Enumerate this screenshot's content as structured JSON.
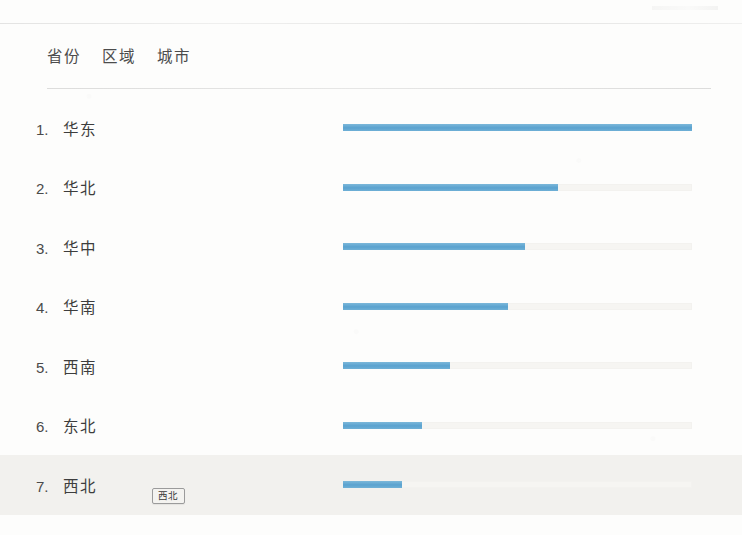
{
  "tabs": [
    {
      "label": "省份",
      "selected": false
    },
    {
      "label": "区域",
      "selected": false
    },
    {
      "label": "城市",
      "selected": false
    }
  ],
  "tooltip": {
    "label": "西北"
  },
  "colors": {
    "bar_fill": "#62a9d3",
    "bar_track": "#f6f5f2",
    "row_highlight": "#f2f1ee",
    "text": "#3d3d3d"
  },
  "chart_data": {
    "type": "bar",
    "orientation": "horizontal",
    "title": "",
    "xlabel": "",
    "ylabel": "",
    "grid": false,
    "legend": null,
    "axis_range": [
      0,
      100
    ],
    "track_full_width_px": 349,
    "categories": [
      "华东",
      "华北",
      "华中",
      "华南",
      "西南",
      "东北",
      "西北"
    ],
    "values": [
      100,
      61.6,
      52.1,
      47.3,
      30.7,
      22.6,
      16.9
    ],
    "ranks": [
      "1.",
      "2.",
      "3.",
      "4.",
      "5.",
      "6.",
      "7."
    ],
    "rows": [
      {
        "rank": "1.",
        "name": "华东",
        "value": 100,
        "pct": "100%"
      },
      {
        "rank": "2.",
        "name": "华北",
        "value": 61.6,
        "pct": "61.6%"
      },
      {
        "rank": "3.",
        "name": "华中",
        "value": 52.1,
        "pct": "52.1%"
      },
      {
        "rank": "4.",
        "name": "华南",
        "value": 47.3,
        "pct": "47.3%"
      },
      {
        "rank": "5.",
        "name": "西南",
        "value": 30.7,
        "pct": "30.7%"
      },
      {
        "rank": "6.",
        "name": "东北",
        "value": 22.6,
        "pct": "22.6%"
      },
      {
        "rank": "7.",
        "name": "西北",
        "value": 16.9,
        "pct": "16.9%"
      }
    ],
    "highlighted_category": "西北"
  }
}
